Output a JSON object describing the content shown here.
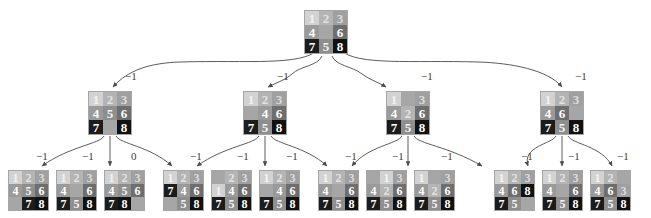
{
  "figure": {
    "type": "search-tree",
    "background_color": "#ffffff",
    "blank_tile_color": "#a6a6a6",
    "tile_palette": {
      "1": "#d2d2d2",
      "2": "#b4b4b4",
      "3": "#a0a0a0",
      "4": "#9a9a9a",
      "5": "#8e8e8e",
      "6": "#6e6e6e",
      "7": "#1c1c1c",
      "8": "#111111"
    }
  },
  "levels": [
    {
      "name": "root",
      "nodes": [
        {
          "id": "r0",
          "x": 304,
          "y": 10,
          "size": 44,
          "cells": [
            "1",
            "2",
            "3",
            "4",
            "",
            "6",
            "7",
            "5",
            "8"
          ]
        }
      ]
    },
    {
      "name": "level-1",
      "nodes": [
        {
          "id": "a0",
          "x": 88,
          "y": 91,
          "size": 44,
          "cells": [
            "1",
            "2",
            "3",
            "4",
            "5",
            "6",
            "7",
            "",
            "8"
          ]
        },
        {
          "id": "a1",
          "x": 243,
          "y": 91,
          "size": 44,
          "cells": [
            "1",
            "2",
            "3",
            "",
            "4",
            "6",
            "7",
            "5",
            "8"
          ]
        },
        {
          "id": "a2",
          "x": 386,
          "y": 91,
          "size": 44,
          "cells": [
            "1",
            "",
            "3",
            "4",
            "2",
            "6",
            "7",
            "5",
            "8"
          ]
        },
        {
          "id": "a3",
          "x": 540,
          "y": 91,
          "size": 44,
          "cells": [
            "1",
            "2",
            "3",
            "4",
            "6",
            "",
            "7",
            "5",
            "8"
          ]
        }
      ]
    },
    {
      "name": "level-2",
      "nodes": [
        {
          "id": "b00",
          "x": 8,
          "y": 170,
          "size": 41,
          "cells": [
            "1",
            "2",
            "3",
            "4",
            "5",
            "6",
            "",
            "7",
            "8"
          ]
        },
        {
          "id": "b01",
          "x": 56,
          "y": 170,
          "size": 41,
          "cells": [
            "1",
            "2",
            "3",
            "4",
            "",
            "6",
            "7",
            "5",
            "8"
          ]
        },
        {
          "id": "b02",
          "x": 104,
          "y": 170,
          "size": 41,
          "cells": [
            "1",
            "2",
            "3",
            "4",
            "5",
            "6",
            "7",
            "8",
            ""
          ]
        },
        {
          "id": "b10",
          "x": 163,
          "y": 170,
          "size": 41,
          "cells": [
            "1",
            "2",
            "3",
            "7",
            "4",
            "6",
            "",
            "5",
            "8"
          ]
        },
        {
          "id": "b11",
          "x": 211,
          "y": 170,
          "size": 41,
          "cells": [
            "",
            "2",
            "3",
            "1",
            "4",
            "6",
            "7",
            "5",
            "8"
          ]
        },
        {
          "id": "b12",
          "x": 259,
          "y": 170,
          "size": 41,
          "cells": [
            "1",
            "2",
            "3",
            "",
            "4",
            "6",
            "7",
            "5",
            "8"
          ]
        },
        {
          "id": "b20",
          "x": 318,
          "y": 170,
          "size": 41,
          "cells": [
            "1",
            "2",
            "3",
            "4",
            "",
            "6",
            "7",
            "5",
            "8"
          ]
        },
        {
          "id": "b21",
          "x": 366,
          "y": 170,
          "size": 41,
          "cells": [
            "",
            "1",
            "3",
            "4",
            "2",
            "6",
            "7",
            "5",
            "8"
          ]
        },
        {
          "id": "b22",
          "x": 414,
          "y": 170,
          "size": 41,
          "cells": [
            "1",
            "",
            "3",
            "4",
            "2",
            "6",
            "7",
            "5",
            "8"
          ]
        },
        {
          "id": "b30",
          "x": 494,
          "y": 170,
          "size": 41,
          "cells": [
            "1",
            "2",
            "3",
            "4",
            "6",
            "8",
            "7",
            "5",
            ""
          ]
        },
        {
          "id": "b31",
          "x": 542,
          "y": 170,
          "size": 41,
          "cells": [
            "1",
            "2",
            "3",
            "4",
            "",
            "6",
            "7",
            "5",
            "8"
          ]
        },
        {
          "id": "b32",
          "x": 590,
          "y": 170,
          "size": 41,
          "cells": [
            "1",
            "2",
            "",
            "4",
            "6",
            "3",
            "7",
            "5",
            "8"
          ]
        }
      ]
    }
  ],
  "edge_labels": [
    {
      "id": "e-a0",
      "text": "−1",
      "x": 125,
      "y": 70
    },
    {
      "id": "e-a1",
      "text": "−1",
      "x": 277,
      "y": 70
    },
    {
      "id": "e-a2",
      "text": "−1",
      "x": 421,
      "y": 70
    },
    {
      "id": "e-a3",
      "text": "−1",
      "x": 575,
      "y": 70
    },
    {
      "id": "e-b00",
      "text": "−1",
      "x": 36,
      "y": 150
    },
    {
      "id": "e-b01",
      "text": "−1",
      "x": 82,
      "y": 150
    },
    {
      "id": "e-b02",
      "text": "0",
      "x": 131,
      "y": 150
    },
    {
      "id": "e-b10",
      "text": "−1",
      "x": 190,
      "y": 150
    },
    {
      "id": "e-b11",
      "text": "−1",
      "x": 237,
      "y": 150
    },
    {
      "id": "e-b12",
      "text": "−1",
      "x": 286,
      "y": 150
    },
    {
      "id": "e-b20",
      "text": "−1",
      "x": 345,
      "y": 150
    },
    {
      "id": "e-b21",
      "text": "−1",
      "x": 392,
      "y": 150
    },
    {
      "id": "e-b22",
      "text": "−1",
      "x": 441,
      "y": 150
    },
    {
      "id": "e-b30",
      "text": "−1",
      "x": 521,
      "y": 150
    },
    {
      "id": "e-b31",
      "text": "−1",
      "x": 568,
      "y": 150
    },
    {
      "id": "e-b32",
      "text": "−1",
      "x": 617,
      "y": 150
    }
  ],
  "edges": [
    {
      "from": "r0",
      "to": "a0",
      "path": "M 318 50 C 300 66, 250 60, 180 62 C 150 63, 128 70, 113 87"
    },
    {
      "from": "r0",
      "to": "a1",
      "path": "M 322 56 C 318 66, 300 66, 292 74 C 285 80, 278 82, 268 87"
    },
    {
      "from": "r0",
      "to": "a2",
      "path": "M 332 56 C 336 66, 352 66, 362 74 C 370 80, 378 82, 386 87"
    },
    {
      "from": "r0",
      "to": "a3",
      "path": "M 340 50 C 358 66, 410 60, 478 62 C 512 63, 548 70, 562 87"
    },
    {
      "from": "a0",
      "to": "b00",
      "path": "M 104 136 C 100 144, 70 146, 42 166"
    },
    {
      "from": "a0",
      "to": "b01",
      "path": "M 110 136 L 110 166"
    },
    {
      "from": "a0",
      "to": "b02",
      "path": "M 116 136 C 120 144, 150 146, 172 166"
    },
    {
      "from": "a1",
      "to": "b10",
      "path": "M 259 136 C 255 144, 225 146, 197 166"
    },
    {
      "from": "a1",
      "to": "b11",
      "path": "M 265 136 L 265 166"
    },
    {
      "from": "a1",
      "to": "b12",
      "path": "M 271 136 C 275 144, 305 146, 327 166"
    },
    {
      "from": "a2",
      "to": "b20",
      "path": "M 402 136 C 398 144, 368 146, 352 166"
    },
    {
      "from": "a2",
      "to": "b21",
      "path": "M 408 136 L 408 166"
    },
    {
      "from": "a2",
      "to": "b22",
      "path": "M 414 136 C 418 144, 448 146, 482 166"
    },
    {
      "from": "a3",
      "to": "b30",
      "path": "M 556 136 C 552 144, 522 146, 528 166"
    },
    {
      "from": "a3",
      "to": "b31",
      "path": "M 562 136 L 562 166"
    },
    {
      "from": "a3",
      "to": "b32",
      "path": "M 568 136 C 572 144, 602 146, 612 166"
    }
  ]
}
